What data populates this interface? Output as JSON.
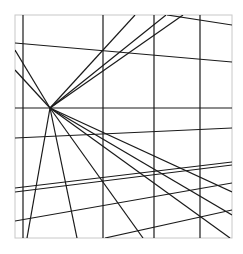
{
  "diagram": {
    "title": "",
    "width": 243,
    "height": 254,
    "background": "#ffffff",
    "frame": {
      "x1": 15,
      "y1": 15,
      "x2": 232,
      "y2": 238,
      "stroke": "#c8c8c8",
      "width": 1
    },
    "line_color": "#1a1a1a",
    "line_width": 1.2,
    "vanishing_point": {
      "x": 50,
      "y": 108
    },
    "vertical_lines": [
      23,
      103,
      154,
      200
    ],
    "horizontal_lines": [
      108
    ],
    "other_lines": [
      {
        "x1": 15,
        "y1": 43,
        "x2": 232,
        "y2": 62
      },
      {
        "x1": 167,
        "y1": 15,
        "x2": 232,
        "y2": 25
      },
      {
        "x1": 15,
        "y1": 138,
        "x2": 232,
        "y2": 128
      },
      {
        "x1": 15,
        "y1": 188,
        "x2": 232,
        "y2": 162
      },
      {
        "x1": 15,
        "y1": 192,
        "x2": 232,
        "y2": 165
      },
      {
        "x1": 15,
        "y1": 221,
        "x2": 232,
        "y2": 183
      },
      {
        "x1": 105,
        "y1": 238,
        "x2": 232,
        "y2": 210
      }
    ],
    "rays": [
      {
        "x": 15,
        "y": 50
      },
      {
        "x": 15,
        "y": 70
      },
      {
        "x": 135,
        "y": 15
      },
      {
        "x": 166,
        "y": 15
      },
      {
        "x": 183,
        "y": 15
      },
      {
        "x": 27,
        "y": 238
      },
      {
        "x": 77,
        "y": 238
      },
      {
        "x": 143,
        "y": 238
      },
      {
        "x": 230,
        "y": 238
      },
      {
        "x": 232,
        "y": 192
      },
      {
        "x": 232,
        "y": 215
      }
    ]
  }
}
